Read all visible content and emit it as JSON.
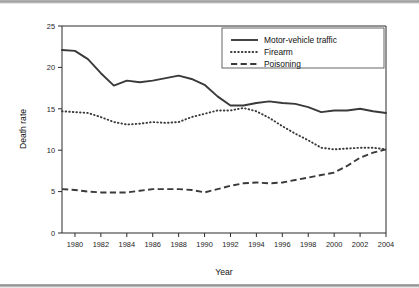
{
  "chart_data": {
    "type": "line",
    "title": "",
    "xlabel": "Year",
    "ylabel": "Death rate",
    "xlim": [
      1979,
      2004
    ],
    "ylim": [
      0,
      25
    ],
    "yticks": [
      0,
      5,
      10,
      15,
      20,
      25
    ],
    "xticks": [
      1980,
      1982,
      1984,
      1986,
      1988,
      1990,
      1992,
      1994,
      1996,
      1998,
      2000,
      2002,
      2004
    ],
    "grid": false,
    "legend_position": "top-right",
    "x": [
      1979,
      1980,
      1981,
      1982,
      1983,
      1984,
      1985,
      1986,
      1987,
      1988,
      1989,
      1990,
      1991,
      1992,
      1993,
      1994,
      1995,
      1996,
      1997,
      1998,
      1999,
      2000,
      2001,
      2002,
      2003,
      2004
    ],
    "series": [
      {
        "name": "Motor-vehicle traffic",
        "style": "solid",
        "values": [
          22.1,
          22.0,
          21.0,
          19.3,
          17.8,
          18.4,
          18.2,
          18.4,
          18.7,
          19.0,
          18.6,
          17.9,
          16.5,
          15.4,
          15.4,
          15.7,
          15.9,
          15.7,
          15.6,
          15.2,
          14.6,
          14.8,
          14.8,
          15.0,
          14.7,
          14.5
        ]
      },
      {
        "name": "Firearm",
        "style": "dotted",
        "values": [
          14.7,
          14.6,
          14.5,
          14.0,
          13.4,
          13.1,
          13.2,
          13.4,
          13.3,
          13.4,
          14.0,
          14.4,
          14.8,
          14.8,
          15.1,
          14.7,
          13.9,
          12.9,
          12.0,
          11.2,
          10.3,
          10.1,
          10.2,
          10.3,
          10.3,
          10.1
        ]
      },
      {
        "name": "Poisoning",
        "style": "dashed",
        "values": [
          5.3,
          5.2,
          5.0,
          4.9,
          4.9,
          4.9,
          5.1,
          5.3,
          5.3,
          5.3,
          5.2,
          4.9,
          5.3,
          5.7,
          6.0,
          6.1,
          6.0,
          6.1,
          6.4,
          6.7,
          7.0,
          7.3,
          8.1,
          9.1,
          9.7,
          10.1
        ]
      }
    ]
  },
  "legend": {
    "items": [
      {
        "label": "Motor-vehicle traffic",
        "style": "solid"
      },
      {
        "label": "Firearm",
        "style": "dotted"
      },
      {
        "label": "Poisoning",
        "style": "dashed"
      }
    ]
  },
  "axes": {
    "y_title": "Death rate",
    "x_title": "Year"
  }
}
